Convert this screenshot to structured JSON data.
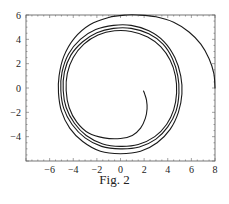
{
  "caption": "Fig. 2",
  "chart_data": {
    "type": "line",
    "title": "",
    "caption": "Fig. 2",
    "xlabel": "",
    "ylabel": "",
    "xlim": [
      -8,
      8
    ],
    "ylim": [
      -6,
      6
    ],
    "grid": false,
    "legend": null,
    "x_ticks": [
      -6,
      -4,
      -2,
      0,
      2,
      4,
      6,
      8
    ],
    "y_ticks": [
      -4,
      -2,
      0,
      2,
      4,
      6
    ],
    "series": [
      {
        "name": "trajectory",
        "description": "Phase-plane spiral starting at (8,0), arcing up over top (~0.7,6.0), then spiraling inward through ~4 loops to end near (2,-0.25)",
        "points": [
          [
            8.0,
            0.0
          ],
          [
            7.9,
            1.2
          ],
          [
            7.5,
            2.4
          ],
          [
            6.8,
            3.6
          ],
          [
            5.8,
            4.6
          ],
          [
            4.5,
            5.4
          ],
          [
            3.0,
            5.85
          ],
          [
            1.5,
            6.0
          ],
          [
            0.5,
            6.0
          ],
          [
            -1.0,
            5.8
          ],
          [
            -2.6,
            5.2
          ],
          [
            -3.9,
            4.1
          ],
          [
            -4.8,
            2.6
          ],
          [
            -5.2,
            1.0
          ],
          [
            -5.25,
            -0.4
          ],
          [
            -5.0,
            -1.9
          ],
          [
            -4.3,
            -3.3
          ],
          [
            -3.2,
            -4.4
          ],
          [
            -1.7,
            -5.2
          ],
          [
            0.0,
            -5.4
          ],
          [
            1.7,
            -5.2
          ],
          [
            3.1,
            -4.5
          ],
          [
            4.2,
            -3.4
          ],
          [
            4.9,
            -2.0
          ],
          [
            5.2,
            -0.5
          ],
          [
            5.1,
            1.0
          ],
          [
            4.6,
            2.5
          ],
          [
            3.7,
            3.8
          ],
          [
            2.4,
            4.7
          ],
          [
            0.9,
            5.15
          ],
          [
            -0.6,
            5.15
          ],
          [
            -2.1,
            4.8
          ],
          [
            -3.4,
            4.0
          ],
          [
            -4.4,
            2.8
          ],
          [
            -4.95,
            1.3
          ],
          [
            -5.05,
            -0.2
          ],
          [
            -4.8,
            -1.7
          ],
          [
            -4.1,
            -3.0
          ],
          [
            -3.0,
            -4.1
          ],
          [
            -1.6,
            -4.8
          ],
          [
            0.0,
            -5.0
          ],
          [
            1.6,
            -4.85
          ],
          [
            3.0,
            -4.2
          ],
          [
            4.0,
            -3.2
          ],
          [
            4.7,
            -1.9
          ],
          [
            4.95,
            -0.4
          ],
          [
            4.85,
            1.0
          ],
          [
            4.4,
            2.4
          ],
          [
            3.6,
            3.6
          ],
          [
            2.4,
            4.45
          ],
          [
            0.9,
            4.9
          ],
          [
            -0.6,
            4.9
          ],
          [
            -2.0,
            4.55
          ],
          [
            -3.2,
            3.8
          ],
          [
            -4.2,
            2.7
          ],
          [
            -4.75,
            1.3
          ],
          [
            -4.85,
            -0.2
          ],
          [
            -4.6,
            -1.6
          ],
          [
            -3.9,
            -2.9
          ],
          [
            -2.9,
            -3.9
          ],
          [
            -1.5,
            -4.6
          ],
          [
            0.0,
            -4.8
          ],
          [
            1.5,
            -4.65
          ],
          [
            2.9,
            -4.0
          ],
          [
            3.9,
            -3.0
          ],
          [
            4.5,
            -1.8
          ],
          [
            4.75,
            -0.4
          ],
          [
            4.65,
            1.0
          ],
          [
            4.2,
            2.3
          ],
          [
            3.4,
            3.4
          ],
          [
            2.3,
            4.2
          ],
          [
            0.9,
            4.65
          ],
          [
            -0.5,
            4.7
          ],
          [
            -1.9,
            4.35
          ],
          [
            -3.1,
            3.6
          ],
          [
            -4.0,
            2.5
          ],
          [
            -4.5,
            1.2
          ],
          [
            -4.6,
            -0.2
          ],
          [
            -4.35,
            -1.6
          ],
          [
            -3.7,
            -2.8
          ],
          [
            -2.7,
            -3.7
          ],
          [
            -1.4,
            -4.1
          ],
          [
            0.0,
            -4.15
          ],
          [
            1.0,
            -3.9
          ],
          [
            1.7,
            -3.3
          ],
          [
            2.1,
            -2.5
          ],
          [
            2.25,
            -1.7
          ],
          [
            2.2,
            -1.0
          ],
          [
            2.05,
            -0.5
          ],
          [
            1.95,
            -0.25
          ]
        ]
      }
    ]
  }
}
